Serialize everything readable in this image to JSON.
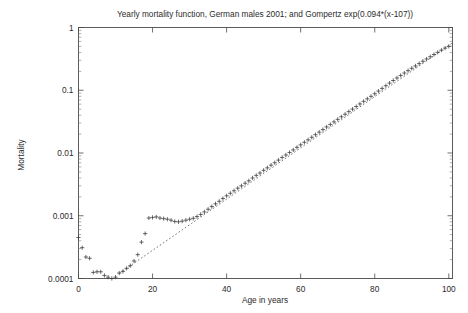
{
  "figure": {
    "title": "Yearly mortality function, German males 2001; and Gompertz exp(0.094*(x-107))",
    "background_color": "#ffffff",
    "axis_color": "#4a4a4a",
    "marker_color": "#3a3a3a",
    "fit_line_color": "#555555"
  },
  "axes": {
    "x_label": "Age in years",
    "y_label": "Mortality",
    "x_ticks": [
      "0",
      "20",
      "40",
      "60",
      "80",
      "100"
    ],
    "y_ticks": [
      "1",
      "0.1",
      "0.01",
      "0.001",
      "0.0001"
    ]
  },
  "chart_data": {
    "type": "scatter",
    "title": "Yearly mortality function, German males 2001; and Gompertz exp(0.094*(x-107))",
    "xlabel": "Age in years",
    "ylabel": "Mortality",
    "xlim": [
      0,
      101
    ],
    "ylim": [
      0.0001,
      1
    ],
    "yscale": "log",
    "xscale": "linear",
    "grid": false,
    "legend": "none",
    "series": [
      {
        "name": "Yearly mortality function, German males 2001",
        "type": "scatter",
        "marker": "plus",
        "x": [
          0,
          1,
          2,
          3,
          4,
          5,
          6,
          7,
          8,
          9,
          10,
          11,
          12,
          13,
          14,
          15,
          16,
          17,
          18,
          19,
          20,
          21,
          22,
          23,
          24,
          25,
          26,
          27,
          28,
          29,
          30,
          31,
          32,
          33,
          34,
          35,
          36,
          37,
          38,
          39,
          40,
          41,
          42,
          43,
          44,
          45,
          46,
          47,
          48,
          49,
          50,
          51,
          52,
          53,
          54,
          55,
          56,
          57,
          58,
          59,
          60,
          61,
          62,
          63,
          64,
          65,
          66,
          67,
          68,
          69,
          70,
          71,
          72,
          73,
          74,
          75,
          76,
          77,
          78,
          79,
          80,
          81,
          82,
          83,
          84,
          85,
          86,
          87,
          88,
          89,
          90,
          91,
          92,
          93,
          94,
          95,
          96,
          97,
          98,
          99,
          100
        ],
        "y": [
          0.00045,
          0.00031,
          0.00022,
          0.00021,
          0.000125,
          0.000128,
          0.000128,
          0.000112,
          0.000105,
          0.0001,
          0.000105,
          0.000122,
          0.00013,
          0.000145,
          0.00016,
          0.00019,
          0.00024,
          0.00038,
          0.00052,
          0.00092,
          0.00094,
          0.00096,
          0.00092,
          0.0009,
          0.00088,
          0.00085,
          0.00081,
          0.0008,
          0.00082,
          0.00085,
          0.00088,
          0.00091,
          0.00097,
          0.00105,
          0.00115,
          0.00127,
          0.0014,
          0.00155,
          0.0017,
          0.00188,
          0.00208,
          0.00228,
          0.0025,
          0.00275,
          0.003,
          0.0033,
          0.0036,
          0.004,
          0.0044,
          0.0048,
          0.0053,
          0.0058,
          0.0064,
          0.007,
          0.0077,
          0.0085,
          0.0093,
          0.0102,
          0.0112,
          0.0123,
          0.0135,
          0.0148,
          0.0162,
          0.0178,
          0.0196,
          0.0215,
          0.0236,
          0.026,
          0.0285,
          0.0313,
          0.0344,
          0.0378,
          0.0415,
          0.0456,
          0.05,
          0.055,
          0.0605,
          0.0665,
          0.073,
          0.08,
          0.088,
          0.097,
          0.107,
          0.118,
          0.13,
          0.143,
          0.157,
          0.172,
          0.188,
          0.205,
          0.224,
          0.244,
          0.266,
          0.29,
          0.315,
          0.342,
          0.371,
          0.402,
          0.435,
          0.47,
          0.5
        ]
      },
      {
        "name": "Gompertz exp(0.094*(x-107))",
        "type": "line",
        "style": "dotted",
        "formula": "exp(0.094*(x-107))",
        "x_range": [
          11,
          101
        ]
      }
    ],
    "annotations": [
      {
        "text": "infant mortality elevated at age 0",
        "value": 0.00045
      },
      {
        "text": "minimum near age 9-10",
        "value": 0.0001
      },
      {
        "text": "accident hump near age 19-21",
        "value": 0.00095
      },
      {
        "text": "mortality at age 100",
        "value": 0.5
      }
    ]
  }
}
